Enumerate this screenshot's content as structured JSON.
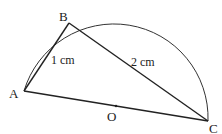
{
  "diagram": {
    "type": "geometry",
    "points": {
      "A": {
        "label": "A",
        "x": 24,
        "y": 91
      },
      "B": {
        "label": "B",
        "x": 69,
        "y": 23
      },
      "C": {
        "label": "C",
        "x": 208,
        "y": 121
      },
      "O": {
        "label": "O",
        "x": 116,
        "y": 106
      }
    },
    "segments": [
      {
        "from": "A",
        "to": "B",
        "label": "1 cm"
      },
      {
        "from": "B",
        "to": "C",
        "label": "2 cm"
      },
      {
        "from": "A",
        "to": "C",
        "label": ""
      }
    ],
    "labels": {
      "A": "A",
      "B": "B",
      "C": "C",
      "O": "O",
      "AB": "1 cm",
      "BC": "2 cm"
    },
    "colors": {
      "stroke": "#222222",
      "background": "#ffffff"
    }
  }
}
